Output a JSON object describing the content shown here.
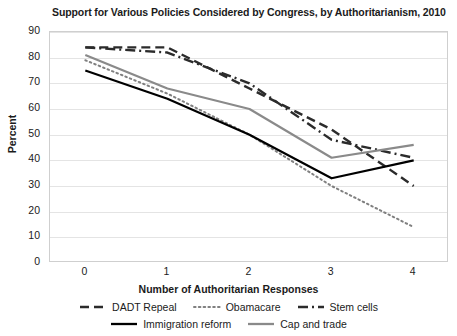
{
  "chart_data": {
    "type": "line",
    "title": "Support for Various Policies Considered by Congress, by Authoritarianism, 2010",
    "xlabel": "Number of Authoritarian Responses",
    "ylabel": "Percent",
    "x": [
      0,
      1,
      2,
      3,
      4
    ],
    "xticklabels": [
      "0",
      "1",
      "2",
      "3",
      "4"
    ],
    "yticklabels": [
      "0",
      "10",
      "20",
      "30",
      "40",
      "50",
      "60",
      "70",
      "80",
      "90"
    ],
    "ylim": [
      0,
      90
    ],
    "xlim": [
      -0.43,
      4.43
    ],
    "grid": true,
    "legend_position": "bottom",
    "series": [
      {
        "name": "DADT Repeal",
        "style": "dashed",
        "color": "#2b2b2b",
        "values": [
          84,
          84,
          68,
          52,
          30
        ]
      },
      {
        "name": "Obamacare",
        "style": "dotted",
        "color": "#808080",
        "values": [
          79,
          66,
          50,
          30,
          14
        ]
      },
      {
        "name": "Stem cells",
        "style": "dashdot",
        "color": "#2b2b2b",
        "values": [
          84,
          82,
          70,
          48,
          41
        ]
      },
      {
        "name": "Immigration reform",
        "style": "solid",
        "color": "#000000",
        "values": [
          75,
          64,
          50,
          33,
          40
        ]
      },
      {
        "name": "Cap and trade",
        "style": "solid",
        "color": "#8a8a8a",
        "values": [
          81,
          68,
          60,
          41,
          46
        ]
      }
    ]
  },
  "legend": {
    "row1": [
      "DADT Repeal",
      "Obamacare",
      "Stem cells"
    ],
    "row2": [
      "Immigration reform",
      "Cap and trade"
    ]
  }
}
